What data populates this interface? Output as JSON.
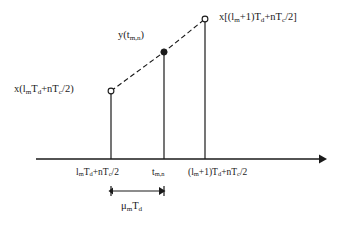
{
  "figure": {
    "kind": "linear-interpolation-timing-diagram",
    "width": 343,
    "height": 228,
    "background_color": "#ffffff",
    "ink_color": "#1a1a1a"
  },
  "axis": {
    "name": "time-axis",
    "orientation": "horizontal",
    "y": 159,
    "x_start": 36,
    "x_end": 325,
    "has_arrowhead_right": true,
    "label": ""
  },
  "samples": [
    {
      "id": "left-sample",
      "marker": "open-circle",
      "x": 111,
      "y": 91,
      "stem_top": 91,
      "stem_bottom": 159,
      "value_label": "x(lmTd+nTc/2)",
      "axis_tick_label": "lmTd+nTc/2"
    },
    {
      "id": "interpolated-sample",
      "marker": "filled-circle",
      "x": 164,
      "y": 52,
      "stem_top": 52,
      "stem_bottom": 159,
      "value_label": "y(tm,n)",
      "axis_tick_label": "tm,n"
    },
    {
      "id": "right-sample",
      "marker": "open-circle",
      "x": 205,
      "y": 19,
      "stem_top": 19,
      "stem_bottom": 159,
      "value_label": "x[(lm+1)Td+nTc/2]",
      "axis_tick_label": "(lm+1)Td+nTc/2"
    }
  ],
  "interpolation_line": {
    "name": "interpolation-dashed-line",
    "style": "dashed",
    "dash_pattern": "5 3",
    "points": [
      [
        111,
        91
      ],
      [
        164,
        52
      ],
      [
        205,
        19
      ]
    ]
  },
  "measurement": {
    "name": "mu-m-td-measurement",
    "label": "μmTd",
    "x_start": 111,
    "x_end": 164,
    "y": 191,
    "arrow_left": true,
    "arrow_right": true
  },
  "labels": {
    "left_value": {
      "text": "x(lmTd+nTc/2)",
      "x": 14,
      "y": 84,
      "parts": [
        "x(l",
        "m",
        "T",
        "d",
        "+nT",
        "c",
        "/2)"
      ]
    },
    "mid_value": {
      "text": "y(tm,n)",
      "x": 118,
      "y": 30,
      "parts": [
        "y(t",
        "m,n",
        ")"
      ]
    },
    "right_value": {
      "text": "x[(lm+1)Td+nTc/2]",
      "x": 219,
      "y": 12,
      "parts": [
        "x[(l",
        "m",
        "+1)T",
        "d",
        "+nT",
        "c",
        "/2]"
      ]
    },
    "axis_left": {
      "text": "lmTd+nTc/2",
      "x": 76,
      "y": 168
    },
    "axis_mid": {
      "text": "tm,n",
      "x": 152,
      "y": 168
    },
    "axis_right": {
      "text": "(lm+1)Td+nTc/2",
      "x": 188,
      "y": 168
    },
    "measurement_label": {
      "text": "μmTd",
      "x": 121,
      "y": 201
    }
  }
}
